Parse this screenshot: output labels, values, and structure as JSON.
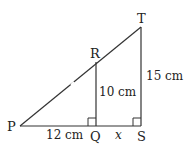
{
  "diagram": {
    "type": "geometry-similar-triangles",
    "stroke_color": "#333333",
    "points": {
      "P": {
        "label": "P",
        "x": 20,
        "y": 126
      },
      "Q": {
        "label": "Q",
        "x": 96,
        "y": 126
      },
      "S": {
        "label": "S",
        "x": 141,
        "y": 126
      },
      "R": {
        "label": "R",
        "x": 96,
        "y": 62
      },
      "T": {
        "label": "T",
        "x": 141,
        "y": 27
      }
    },
    "segments": [
      {
        "from": "P",
        "to": "S"
      },
      {
        "from": "P",
        "to": "T"
      },
      {
        "from": "Q",
        "to": "R"
      },
      {
        "from": "S",
        "to": "T"
      }
    ],
    "right_angles": [
      "Q",
      "S"
    ],
    "measurements": {
      "PQ": "12 cm",
      "QR": "10 cm",
      "ST": "15 cm",
      "QS": "x"
    }
  }
}
